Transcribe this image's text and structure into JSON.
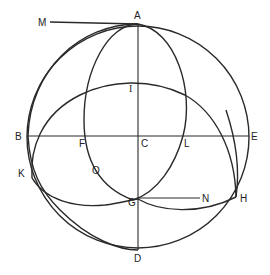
{
  "diagram": {
    "type": "geometric-construction",
    "stroke_color": "#2a2a2a",
    "labels": {
      "A": "A",
      "B": "B",
      "C": "C",
      "D": "D",
      "E": "E",
      "F": "F",
      "G": "G",
      "H": "H",
      "I": "I",
      "K": "K",
      "L": "L",
      "M": "M",
      "N": "N",
      "O": "O"
    },
    "elements": [
      {
        "id": "outer-circle",
        "kind": "circle",
        "description": "Primitive circle ABED centered at C"
      },
      {
        "id": "vertical-diameter",
        "kind": "line",
        "from": "A",
        "to": "D"
      },
      {
        "id": "horizontal-diameter",
        "kind": "line",
        "from": "B",
        "to": "E"
      },
      {
        "id": "tangent-MA",
        "kind": "line",
        "from": "M",
        "to": "A"
      },
      {
        "id": "line-GN",
        "kind": "line",
        "from": "G",
        "to": "N"
      },
      {
        "id": "ellipse-AFGL",
        "kind": "arc",
        "description": "Oval through A, F, O, G, L"
      },
      {
        "id": "arc-KIH",
        "kind": "arc",
        "description": "Arc through K, I, H with lower curve through G"
      },
      {
        "id": "arc-AKD",
        "kind": "arc",
        "description": "Arc from A through K to bottom near D"
      }
    ]
  }
}
